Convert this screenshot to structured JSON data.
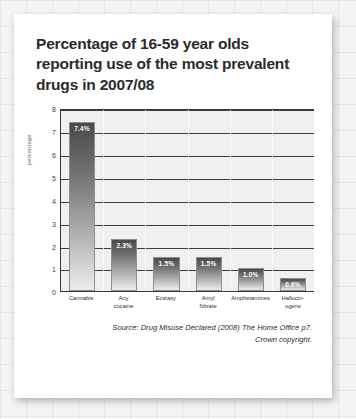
{
  "card": {
    "title": "Percentage of 16-59 year olds reporting use of the most prevalent drugs in 2007/08",
    "source_line1": "Source: Drug Misuse Declared (2008) The Home Office p7.",
    "source_line2": "Crown copyright."
  },
  "chart_data": {
    "type": "bar",
    "title": "Percentage of 16-59 year olds reporting use of the most prevalent drugs in 2007/08",
    "xlabel": "",
    "ylabel": "percentage",
    "ylim": [
      0,
      8
    ],
    "yticks": [
      8,
      7,
      6,
      5,
      4,
      3,
      2,
      1,
      0
    ],
    "grid": true,
    "legend": "none",
    "categories": [
      "Cannabis",
      "Any cocaine",
      "Ecstasy",
      "Amyl Nitrate",
      "Amphetamines",
      "Hallucin-ogens"
    ],
    "category_lines": [
      [
        "Cannabis",
        ""
      ],
      [
        "Any",
        "cocaine"
      ],
      [
        "Ecstasy",
        ""
      ],
      [
        "Amyl",
        "Nitrate"
      ],
      [
        "Amphetamines",
        ""
      ],
      [
        "Hallucin-",
        "ogens"
      ]
    ],
    "values": [
      7.4,
      2.3,
      1.5,
      1.5,
      1.0,
      0.6
    ],
    "data_labels": [
      "7.4%",
      "2.3%",
      "1.5%",
      "1.5%",
      "1.0%",
      "0.6%"
    ],
    "bar_color_top": "#4a4a4a",
    "bar_color_bottom": "#ececec",
    "plot_background": "#f0f0ee",
    "axis_color": "#3a3a3a"
  }
}
